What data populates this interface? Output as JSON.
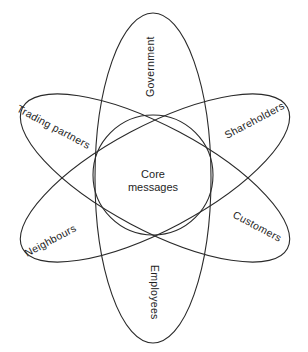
{
  "diagram": {
    "type": "stakeholder-ellipse-diagram",
    "center": {
      "label_line1": "Core",
      "label_line2": "messages"
    },
    "ellipses": [
      {
        "id": "vertical",
        "labels": {
          "top": "Government",
          "bottom": "Employees"
        }
      },
      {
        "id": "tilt-down",
        "labels": {
          "left": "Trading partners",
          "right": "Customers"
        }
      },
      {
        "id": "tilt-up",
        "labels": {
          "left": "Neighbours",
          "right": "Shareholders"
        }
      }
    ],
    "colors": {
      "stroke": "#2a2a2a",
      "text": "#1e1e1e",
      "background": "#ffffff"
    }
  }
}
